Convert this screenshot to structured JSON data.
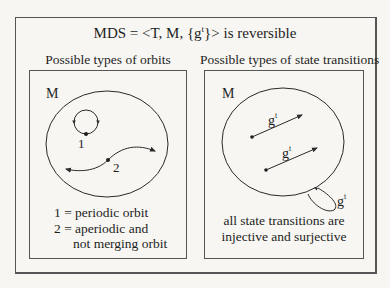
{
  "title": {
    "prefix": "MDS = <T, M, {g",
    "superscript": "t",
    "suffix": "}> is reversible"
  },
  "left_panel": {
    "heading": "Possible types of orbits",
    "space_label": "M",
    "orbit_1_label": "1",
    "orbit_2_label": "2",
    "legend": [
      "1 = periodic orbit",
      "2 = aperiodic and",
      "not merging orbit"
    ]
  },
  "right_panel": {
    "heading": "Possible types of state transitions",
    "space_label": "M",
    "transition_label_base": "g",
    "transition_label_sup": "t",
    "caption": [
      "all state transitions are",
      "injective and surjective"
    ]
  },
  "colors": {
    "background": "#f7f6f2",
    "line": "#2a2a2a",
    "frame": "#555555"
  }
}
